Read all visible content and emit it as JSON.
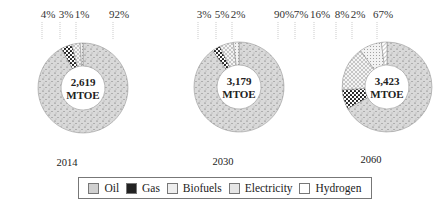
{
  "chart_data": {
    "type": "pie",
    "subtype": "donut",
    "title": "",
    "unit": "MTOE",
    "legend": [
      "Oil",
      "Gas",
      "Biofuels",
      "Electricity",
      "Hydrogen"
    ],
    "legend_position": "bottom",
    "charts": [
      {
        "year": "2014",
        "total_label": "2,619",
        "unit_label": "MTOE",
        "slices": [
          {
            "name": "Oil",
            "value": 92,
            "label": "92%"
          },
          {
            "name": "Gas",
            "value": 4,
            "label": "4%"
          },
          {
            "name": "Biofuels",
            "value": 3,
            "label": "3%"
          },
          {
            "name": "Electricity",
            "value": 1,
            "label": "1%"
          }
        ]
      },
      {
        "year": "2030",
        "total_label": "3,179",
        "unit_label": "MTOE",
        "slices": [
          {
            "name": "Oil",
            "value": 90,
            "label": "90%"
          },
          {
            "name": "Gas",
            "value": 3,
            "label": "3%"
          },
          {
            "name": "Biofuels",
            "value": 5,
            "label": "5%"
          },
          {
            "name": "Electricity",
            "value": 2,
            "label": "2%"
          }
        ]
      },
      {
        "year": "2060",
        "total_label": "3,423",
        "unit_label": "MTOE",
        "slices": [
          {
            "name": "Oil",
            "value": 67,
            "label": "67%"
          },
          {
            "name": "Gas",
            "value": 7,
            "label": "7%"
          },
          {
            "name": "Biofuels",
            "value": 16,
            "label": "16%"
          },
          {
            "name": "Electricity",
            "value": 8,
            "label": "8%"
          },
          {
            "name": "Hydrogen",
            "value": 2,
            "label": "2%"
          }
        ]
      }
    ]
  },
  "legend_items": [
    {
      "label": "Oil",
      "pattern": "oil"
    },
    {
      "label": "Gas",
      "pattern": "gas"
    },
    {
      "label": "Biofuels",
      "pattern": "bio"
    },
    {
      "label": "Electricity",
      "pattern": "elec"
    },
    {
      "label": "Hydrogen",
      "pattern": "hyd"
    }
  ]
}
